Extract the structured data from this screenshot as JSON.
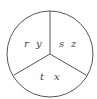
{
  "diagram": {
    "type": "circle-three-sectors",
    "stroke_color": "#555555",
    "background": "#ffffff",
    "sectors": [
      {
        "position": "left",
        "labels": [
          "r",
          "y"
        ]
      },
      {
        "position": "right",
        "labels": [
          "s",
          "z"
        ]
      },
      {
        "position": "bottom",
        "labels": [
          "t",
          "x"
        ]
      }
    ]
  }
}
